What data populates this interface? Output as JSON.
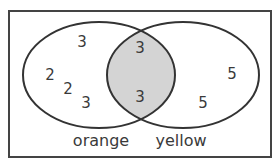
{
  "diagram": {
    "type": "venn",
    "universe_border_color": "#444444",
    "shaded_region": "intersection",
    "shade_color": "#d4d4d4",
    "sets": [
      {
        "name": "orange",
        "label": "orange"
      },
      {
        "name": "yellow",
        "label": "yellow"
      }
    ],
    "regions": {
      "orange_only": [
        "3",
        "2",
        "2",
        "3"
      ],
      "intersection": [
        "3",
        "3"
      ],
      "yellow_only": [
        "5",
        "5"
      ]
    }
  }
}
